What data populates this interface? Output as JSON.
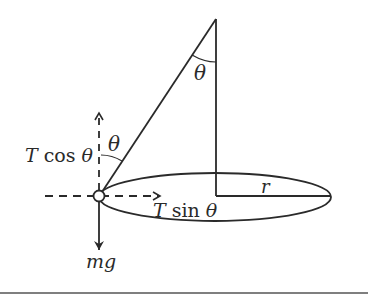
{
  "diagram": {
    "labels": {
      "theta_apex": "θ",
      "theta_bob": "θ",
      "t_cos": "T cos θ",
      "t_sin": "T sin θ",
      "radius": "r",
      "weight": "mg"
    },
    "colors": {
      "ink": "#2a2a2a",
      "background": "#ffffff"
    }
  }
}
